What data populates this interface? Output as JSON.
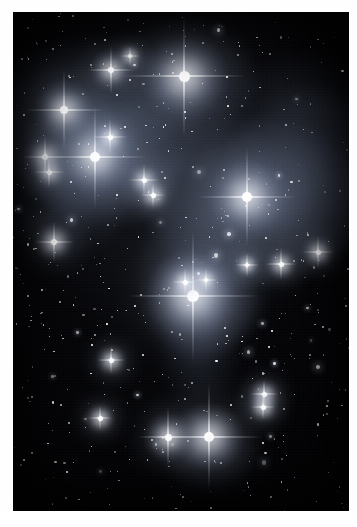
{
  "document": {
    "kind": "astronomical-photograph",
    "subject": "Pleiades star cluster with reflection nebulosity",
    "palette": {
      "paper": "#ffffff",
      "sky_background": "#010103",
      "star_core": "#ffffff",
      "nebula_blue": "#8fa2c8",
      "nebula_grey": "#6f7a92",
      "dust_dark": "#05060a"
    },
    "frame": {
      "photo_left": 13,
      "photo_top": 12,
      "photo_width": 336,
      "photo_height": 499
    }
  },
  "image_content": {
    "type": "scatter",
    "title": "Pleiades star cluster (M45) reflection nebula field",
    "description": "Grayscale deep-sky photograph: bright cluster stars with four-point diffraction spikes embedded in wispy reflection nebulosity, over a dense field of faint background stars.",
    "xlabel": "",
    "ylabel": "",
    "xlim": [
      0,
      336
    ],
    "ylim": [
      0,
      499
    ],
    "grid": false,
    "legend": "none",
    "nebulae": [
      {
        "name": "north-west-veil",
        "x": 78,
        "y": 112,
        "rx": 108,
        "ry": 86,
        "intensity": 0.3,
        "hue": "#93a6cc"
      },
      {
        "name": "maia-nebulosity",
        "x": 88,
        "y": 148,
        "rx": 78,
        "ry": 66,
        "intensity": 0.38,
        "hue": "#9fb0d4"
      },
      {
        "name": "west-lower-wisp",
        "x": 52,
        "y": 196,
        "rx": 62,
        "ry": 48,
        "intensity": 0.2,
        "hue": "#8b9cc2"
      },
      {
        "name": "north-central-glow",
        "x": 172,
        "y": 70,
        "rx": 72,
        "ry": 60,
        "intensity": 0.24,
        "hue": "#98a9cf"
      },
      {
        "name": "central-bridge",
        "x": 160,
        "y": 150,
        "rx": 96,
        "ry": 70,
        "intensity": 0.16,
        "hue": "#7e8dae"
      },
      {
        "name": "merope-nebula",
        "x": 244,
        "y": 190,
        "rx": 110,
        "ry": 82,
        "intensity": 0.42,
        "hue": "#a2b3d8"
      },
      {
        "name": "merope-east-sheet",
        "x": 300,
        "y": 160,
        "rx": 86,
        "ry": 84,
        "intensity": 0.26,
        "hue": "#93a4ca"
      },
      {
        "name": "electra-south-plume",
        "x": 192,
        "y": 262,
        "rx": 66,
        "ry": 78,
        "intensity": 0.3,
        "hue": "#9aabd0"
      },
      {
        "name": "electra-halo",
        "x": 186,
        "y": 292,
        "rx": 54,
        "ry": 54,
        "intensity": 0.34,
        "hue": "#a4b4d8"
      },
      {
        "name": "south-tail",
        "x": 186,
        "y": 346,
        "rx": 40,
        "ry": 48,
        "intensity": 0.18,
        "hue": "#8798bc"
      },
      {
        "name": "double-star-halo",
        "x": 196,
        "y": 437,
        "rx": 48,
        "ry": 40,
        "intensity": 0.22,
        "hue": "#95a6cb"
      },
      {
        "name": "north-east-haze",
        "x": 290,
        "y": 96,
        "rx": 70,
        "ry": 58,
        "intensity": 0.14,
        "hue": "#7d8cad"
      }
    ],
    "bright_stars": [
      {
        "label": "A",
        "x": 171,
        "y": 64,
        "size": 11,
        "glow": 44,
        "spikes": 62,
        "magnitude_rank": 1
      },
      {
        "label": "B",
        "x": 180,
        "y": 284,
        "size": 12,
        "glow": 46,
        "spikes": 66,
        "magnitude_rank": 1
      },
      {
        "label": "C",
        "x": 82,
        "y": 145,
        "size": 10,
        "glow": 40,
        "spikes": 52,
        "magnitude_rank": 2
      },
      {
        "label": "D",
        "x": 234,
        "y": 185,
        "size": 10,
        "glow": 42,
        "spikes": 50,
        "magnitude_rank": 2
      },
      {
        "label": "E",
        "x": 196,
        "y": 425,
        "size": 10,
        "glow": 34,
        "spikes": 54,
        "magnitude_rank": 2
      },
      {
        "label": "F",
        "x": 51,
        "y": 98,
        "size": 8,
        "glow": 30,
        "spikes": 40,
        "magnitude_rank": 3
      },
      {
        "label": "G",
        "x": 155,
        "y": 425,
        "size": 7,
        "glow": 24,
        "spikes": 30,
        "magnitude_rank": 3
      },
      {
        "label": "H",
        "x": 98,
        "y": 58,
        "size": 6,
        "glow": 20,
        "spikes": 24,
        "magnitude_rank": 4
      },
      {
        "label": "I",
        "x": 32,
        "y": 145,
        "size": 6,
        "glow": 20,
        "spikes": 22,
        "magnitude_rank": 4
      },
      {
        "label": "J",
        "x": 97,
        "y": 125,
        "size": 5,
        "glow": 16,
        "spikes": 18,
        "magnitude_rank": 5
      },
      {
        "label": "K",
        "x": 36,
        "y": 160,
        "size": 5,
        "glow": 15,
        "spikes": 16,
        "magnitude_rank": 5
      },
      {
        "label": "L",
        "x": 41,
        "y": 230,
        "size": 6,
        "glow": 18,
        "spikes": 20,
        "magnitude_rank": 4
      },
      {
        "label": "M",
        "x": 131,
        "y": 168,
        "size": 5,
        "glow": 14,
        "spikes": 16,
        "magnitude_rank": 5
      },
      {
        "label": "N",
        "x": 172,
        "y": 270,
        "size": 5,
        "glow": 14,
        "spikes": 14,
        "magnitude_rank": 5
      },
      {
        "label": "O",
        "x": 193,
        "y": 268,
        "size": 4,
        "glow": 12,
        "spikes": 12,
        "magnitude_rank": 6
      },
      {
        "label": "P",
        "x": 305,
        "y": 240,
        "size": 5,
        "glow": 15,
        "spikes": 16,
        "magnitude_rank": 5
      },
      {
        "label": "Q",
        "x": 268,
        "y": 252,
        "size": 5,
        "glow": 14,
        "spikes": 16,
        "magnitude_rank": 5
      },
      {
        "label": "R",
        "x": 234,
        "y": 253,
        "size": 4,
        "glow": 12,
        "spikes": 12,
        "magnitude_rank": 6
      },
      {
        "label": "S",
        "x": 98,
        "y": 348,
        "size": 5,
        "glow": 14,
        "spikes": 14,
        "magnitude_rank": 5
      },
      {
        "label": "T",
        "x": 251,
        "y": 382,
        "size": 5,
        "glow": 14,
        "spikes": 14,
        "magnitude_rank": 5
      },
      {
        "label": "U",
        "x": 250,
        "y": 395,
        "size": 5,
        "glow": 13,
        "spikes": 12,
        "magnitude_rank": 5
      },
      {
        "label": "V",
        "x": 87,
        "y": 406,
        "size": 5,
        "glow": 13,
        "spikes": 12,
        "magnitude_rank": 5
      },
      {
        "label": "W",
        "x": 140,
        "y": 183,
        "size": 5,
        "glow": 13,
        "spikes": 12,
        "magnitude_rank": 5
      },
      {
        "label": "X",
        "x": 117,
        "y": 44,
        "size": 4,
        "glow": 11,
        "spikes": 10,
        "magnitude_rank": 6
      }
    ],
    "field_star_count": 520,
    "field_star_seed": 20240516
  }
}
